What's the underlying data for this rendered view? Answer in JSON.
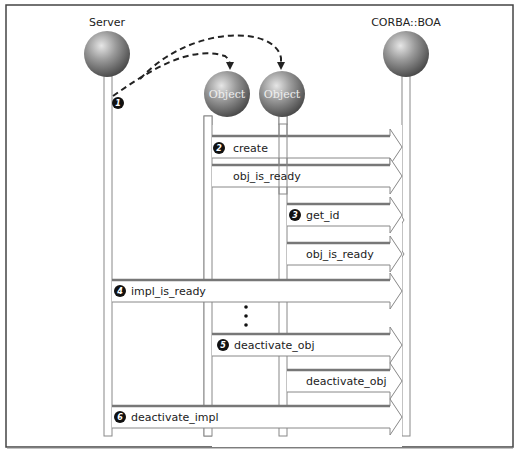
{
  "diagram": {
    "type": "sequence-diagram",
    "participants": [
      {
        "id": "server",
        "label": "Server",
        "x": 108,
        "cy": 54,
        "has_header_label": true
      },
      {
        "id": "object1",
        "label": "Object",
        "x": 208,
        "cy": 94,
        "has_header_label": false
      },
      {
        "id": "object2",
        "label": "Object",
        "x": 283,
        "cy": 94,
        "has_header_label": false
      },
      {
        "id": "boa",
        "label": "CORBA::BOA",
        "x": 406,
        "cy": 54,
        "has_header_label": true
      }
    ],
    "creation_arrows": [
      {
        "from": "server",
        "to": "object1",
        "style": "dashed",
        "step": "1"
      },
      {
        "from": "server",
        "to": "object2",
        "style": "dashed"
      }
    ],
    "messages": [
      {
        "step": "2",
        "label": "create",
        "from": "object1",
        "to": "boa",
        "y": 208
      },
      {
        "step": "",
        "label": "obj_is_ready",
        "from": "object1",
        "to": "boa",
        "y": 232
      },
      {
        "step": "3",
        "label": "get_id",
        "from": "object2",
        "to": "boa",
        "y": 205
      },
      {
        "step": "",
        "label": "obj_is_ready",
        "from": "object2",
        "to": "boa",
        "y": 243
      },
      {
        "step": "4",
        "label": "impl_is_ready",
        "from": "server",
        "to": "boa",
        "y": 280
      },
      {
        "step": "5",
        "label": "deactivate_obj",
        "from": "object1",
        "to": "boa",
        "y": 333
      },
      {
        "step": "",
        "label": "deactivate_obj",
        "from": "object2",
        "to": "boa",
        "y": 370
      },
      {
        "step": "6",
        "label": "deactivate_impl",
        "from": "server",
        "to": "boa",
        "y": 405
      }
    ],
    "ellipsis": "⋮",
    "colors": {
      "frame": "#444444",
      "sphere_light": "#d8d8d8",
      "sphere_dark": "#5a5a5a",
      "badge": "#111111",
      "arrow_shadow": "#888888"
    }
  },
  "labels": {
    "server": "Server",
    "boa": "CORBA::BOA",
    "object1": "Object",
    "object2": "Object",
    "step1": "1",
    "step2": "2",
    "step3": "3",
    "step4": "4",
    "step5": "5",
    "step6": "6",
    "m_create": "create",
    "m_obj_ready1": "obj_is_ready",
    "m_get_id": "get_id",
    "m_obj_ready2": "obj_is_ready",
    "m_impl_ready": "impl_is_ready",
    "m_deact_obj1": "deactivate_obj",
    "m_deact_obj2": "deactivate_obj",
    "m_deact_impl": "deactivate_impl"
  }
}
